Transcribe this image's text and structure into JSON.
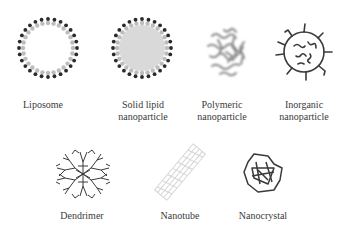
{
  "diagram": {
    "items": [
      {
        "id": "liposome",
        "label_lines": [
          "Liposome"
        ]
      },
      {
        "id": "solid-lipid",
        "label_lines": [
          "Solid lipid",
          "nanoparticle"
        ]
      },
      {
        "id": "polymeric",
        "label_lines": [
          "Polymeric",
          "nanoparticle"
        ]
      },
      {
        "id": "inorganic",
        "label_lines": [
          "Inorganic",
          "nanoparticle"
        ]
      },
      {
        "id": "dendrimer",
        "label_lines": [
          "Dendrimer"
        ]
      },
      {
        "id": "nanotube",
        "label_lines": [
          "Nanotube"
        ]
      },
      {
        "id": "nanocrystal",
        "label_lines": [
          "Nanocrystal"
        ]
      }
    ]
  },
  "colors": {
    "ink": "#3a3a3a",
    "head": "#2a2a2a",
    "tail": "#bdbdbd",
    "core": "#d9d9d9"
  }
}
